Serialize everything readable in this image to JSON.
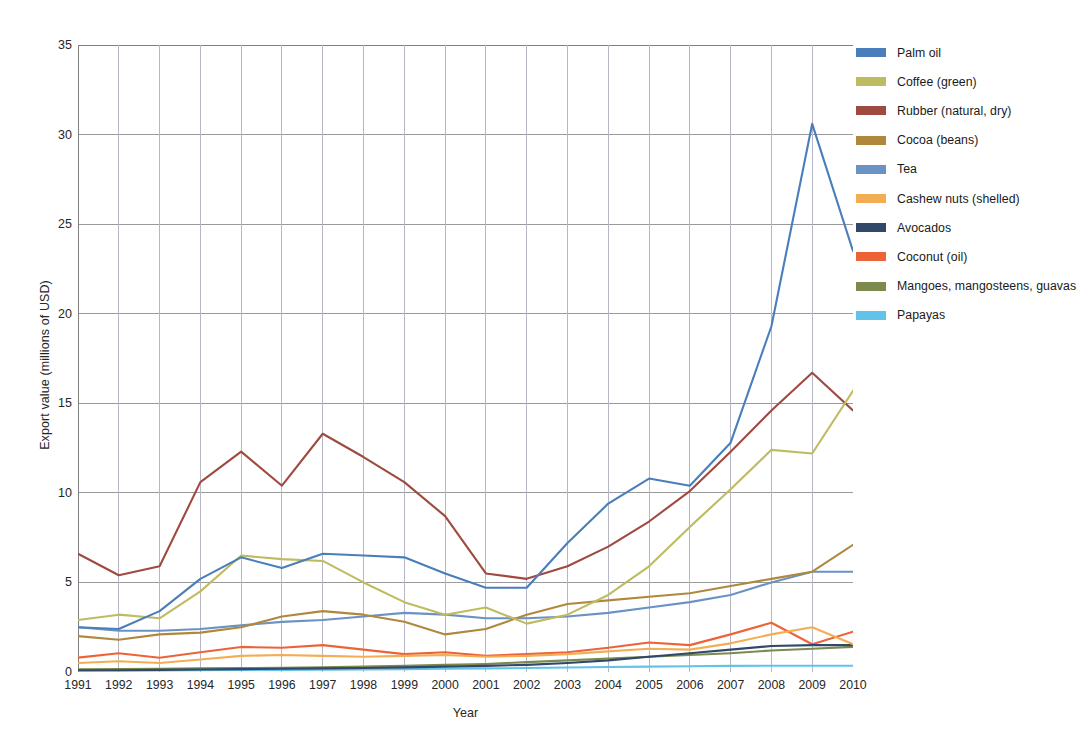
{
  "chart_data": {
    "type": "line",
    "title": "",
    "xlabel": "Year",
    "ylabel": "Export value (millions of USD)",
    "grid": true,
    "legend_position": "right",
    "xlim": [
      1991,
      2010
    ],
    "ylim": [
      0,
      35
    ],
    "yticks": [
      0,
      5,
      10,
      15,
      20,
      25,
      30,
      35
    ],
    "categories": [
      1991,
      1992,
      1993,
      1994,
      1995,
      1996,
      1997,
      1998,
      1999,
      2000,
      2001,
      2002,
      2003,
      2004,
      2005,
      2006,
      2007,
      2008,
      2009,
      2010
    ],
    "x": [
      "1991",
      "1992",
      "1993",
      "1994",
      "1995",
      "1996",
      "1997",
      "1998",
      "1999",
      "2000",
      "2001",
      "2002",
      "2003",
      "2004",
      "2005",
      "2006",
      "2007",
      "2008",
      "2009",
      "2010"
    ],
    "series": [
      {
        "name": "Palm oil",
        "color": "#4a7ebb",
        "values": [
          2.5,
          2.4,
          3.4,
          5.2,
          6.4,
          5.8,
          6.6,
          6.5,
          6.4,
          5.5,
          4.7,
          4.7,
          7.2,
          9.4,
          10.8,
          10.4,
          12.8,
          19.3,
          30.6,
          23.5
        ]
      },
      {
        "name": "Coffee (green)",
        "color": "#bfbb60",
        "values": [
          2.9,
          3.2,
          3.0,
          4.5,
          6.5,
          6.3,
          6.2,
          5.0,
          3.9,
          3.2,
          3.6,
          2.7,
          3.2,
          4.3,
          5.9,
          8.1,
          10.2,
          12.4,
          12.2,
          15.7
        ]
      },
      {
        "name": "Rubber (natural, dry)",
        "color": "#9e4a41"
      },
      {
        "name": "Cocoa (beans)",
        "color": "#b0883d"
      },
      {
        "name": "Tea",
        "color": "#6b92c4"
      },
      {
        "name": "Cashew nuts (shelled)",
        "color": "#f3ad55"
      },
      {
        "name": "Avocados",
        "color": "#31486b"
      },
      {
        "name": "Coconut (oil)",
        "color": "#ec6337"
      },
      {
        "name": "Mangoes, mangosteens, guavas",
        "color": "#7c8a4e"
      },
      {
        "name": "Papayas",
        "color": "#62c3e8"
      }
    ],
    "data": {
      "Palm oil": [
        2.5,
        2.4,
        3.4,
        5.2,
        6.4,
        5.8,
        6.6,
        6.5,
        6.4,
        5.5,
        4.7,
        4.7,
        7.2,
        9.4,
        10.8,
        10.4,
        12.8,
        19.3,
        30.6,
        23.5
      ],
      "Coffee (green)": [
        2.9,
        3.2,
        3.0,
        4.5,
        6.5,
        6.3,
        6.2,
        5.0,
        3.9,
        3.2,
        3.6,
        2.7,
        3.2,
        4.3,
        5.9,
        8.1,
        10.2,
        12.4,
        12.2,
        15.7
      ],
      "Rubber (natural, dry)": [
        6.6,
        5.4,
        5.9,
        10.6,
        12.3,
        10.4,
        13.3,
        12.0,
        10.6,
        8.7,
        5.5,
        5.2,
        5.9,
        7.0,
        8.4,
        10.1,
        12.3,
        14.6,
        16.7,
        14.6
      ],
      "Cocoa (beans)": [
        2.0,
        1.8,
        2.1,
        2.2,
        2.5,
        3.1,
        3.4,
        3.2,
        2.8,
        2.1,
        2.4,
        3.2,
        3.8,
        4.0,
        4.2,
        4.4,
        4.8,
        5.2,
        5.6,
        7.1
      ],
      "Tea": [
        2.5,
        2.3,
        2.3,
        2.4,
        2.6,
        2.8,
        2.9,
        3.1,
        3.3,
        3.2,
        3.0,
        3.0,
        3.1,
        3.3,
        3.6,
        3.9,
        4.3,
        5.0,
        5.6,
        5.6
      ],
      "Cashew nuts (shelled)": [
        0.5,
        0.6,
        0.5,
        0.7,
        0.9,
        0.95,
        0.9,
        0.85,
        0.9,
        0.95,
        0.85,
        0.9,
        1.0,
        1.15,
        1.3,
        1.25,
        1.6,
        2.1,
        2.5,
        1.55
      ],
      "Avocados": [
        0.1,
        0.1,
        0.12,
        0.14,
        0.16,
        0.18,
        0.2,
        0.22,
        0.26,
        0.3,
        0.34,
        0.4,
        0.5,
        0.65,
        0.85,
        1.05,
        1.25,
        1.45,
        1.5,
        1.5
      ],
      "Coconut (oil)": [
        0.8,
        1.05,
        0.8,
        1.1,
        1.4,
        1.35,
        1.5,
        1.25,
        1.0,
        1.1,
        0.9,
        1.0,
        1.1,
        1.35,
        1.65,
        1.5,
        2.1,
        2.75,
        1.55,
        2.25
      ],
      "Mangoes, mangosteens, guavas": [
        0.15,
        0.16,
        0.18,
        0.2,
        0.22,
        0.24,
        0.26,
        0.3,
        0.34,
        0.4,
        0.45,
        0.55,
        0.65,
        0.75,
        0.85,
        0.95,
        1.05,
        1.2,
        1.3,
        1.4
      ],
      "Papayas": [
        0.07,
        0.08,
        0.09,
        0.1,
        0.11,
        0.12,
        0.13,
        0.14,
        0.16,
        0.18,
        0.2,
        0.22,
        0.25,
        0.28,
        0.3,
        0.32,
        0.34,
        0.35,
        0.35,
        0.35
      ]
    },
    "final_values_note": ""
  },
  "legend": {
    "items": [
      {
        "label": "Palm oil",
        "color": "#4a7ebb"
      },
      {
        "label": "Coffee (green)",
        "color": "#bfbb60"
      },
      {
        "label": "Rubber (natural, dry)",
        "color": "#9e4a41"
      },
      {
        "label": "Cocoa (beans)",
        "color": "#b0883d"
      },
      {
        "label": "Tea",
        "color": "#6b92c4"
      },
      {
        "label": "Cashew nuts (shelled)",
        "color": "#f3ad55"
      },
      {
        "label": "Avocados",
        "color": "#31486b"
      },
      {
        "label": "Coconut (oil)",
        "color": "#ec6337"
      },
      {
        "label": "Mangoes, mangosteens, guavas",
        "color": "#7c8a4e"
      },
      {
        "label": "Papayas",
        "color": "#62c3e8"
      }
    ]
  }
}
